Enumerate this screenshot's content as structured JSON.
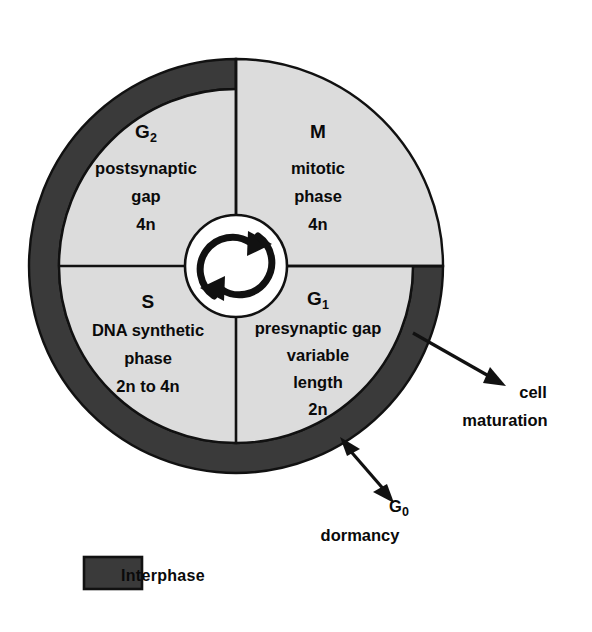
{
  "diagram": {
    "type": "cell-cycle-wheel",
    "colors": {
      "interphase_ring": "#3a3a3a",
      "quadrant_fill": "#dcdcdc",
      "hub_fill": "#ffffff",
      "outline": "#111111",
      "text": "#0a0a0a",
      "background": "#ffffff"
    },
    "geometry": {
      "center_x": 236,
      "center_y": 266,
      "outer_radius": 207,
      "inner_disc_radius": 177,
      "hub_radius": 51,
      "ring_span_note": "dark interphase ring spans G1, S and G2 only; absent along M phase"
    }
  },
  "quadrants": [
    {
      "id": "g2",
      "position": "upper-left",
      "code": "G",
      "code_subscript": "2",
      "lines": [
        "postsynaptic",
        "gap",
        "4n"
      ],
      "ploidy": "4n",
      "in_interphase": true
    },
    {
      "id": "m",
      "position": "upper-right",
      "code": "M",
      "code_subscript": "",
      "lines": [
        "mitotic",
        "phase",
        "4n"
      ],
      "ploidy": "4n",
      "in_interphase": false
    },
    {
      "id": "s",
      "position": "lower-left",
      "code": "S",
      "code_subscript": "",
      "lines": [
        "DNA synthetic",
        "phase",
        "2n to 4n"
      ],
      "ploidy": "2n to 4n",
      "in_interphase": true
    },
    {
      "id": "g1",
      "position": "lower-right",
      "code": "G",
      "code_subscript": "1",
      "lines": [
        "presynaptic gap",
        "variable",
        "length",
        "2n"
      ],
      "ploidy": "2n",
      "in_interphase": true
    }
  ],
  "annotations": [
    {
      "id": "cell-maturation",
      "lines": [
        "cell",
        "maturation"
      ],
      "arrow": "single",
      "direction": "outward-from-ring"
    },
    {
      "id": "g0-dormancy",
      "code": "G",
      "code_subscript": "0",
      "lines": [
        "dormancy"
      ],
      "arrow": "double",
      "direction": "bidirectional-with-ring"
    }
  ],
  "legend": {
    "items": [
      {
        "label": "Interphase",
        "swatch_color": "#3a3a3a"
      }
    ]
  }
}
